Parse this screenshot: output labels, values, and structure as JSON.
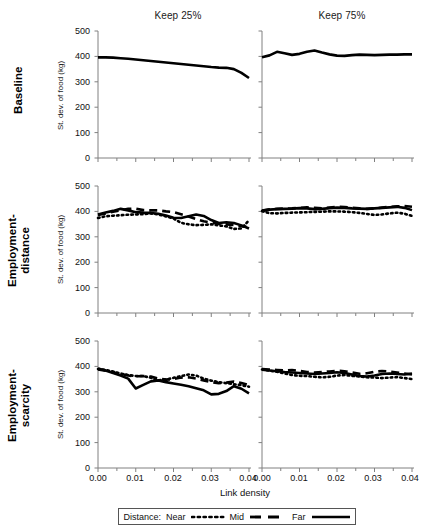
{
  "figure": {
    "column_titles": [
      "Keep 25%",
      "Keep 75%"
    ],
    "row_labels": [
      "Baseline",
      "Employment-\ndistance",
      "Employment-\nscarcity"
    ],
    "ylabel": "St. dev. of food (kg)",
    "xlabel": "Link density",
    "yticks": [
      "500",
      "400",
      "300",
      "200",
      "100",
      "0"
    ],
    "xticks": [
      "0.00",
      "0.01",
      "0.02",
      "0.03",
      "0.04"
    ]
  },
  "legend": {
    "title": "Distance:",
    "entries": [
      {
        "label": "Near",
        "style": "dotted"
      },
      {
        "label": "Mid",
        "style": "dashed"
      },
      {
        "label": "Far",
        "style": "solid"
      }
    ]
  },
  "colors": {
    "line": "#000000",
    "axis": "#808080",
    "text": "#111111",
    "background": "#ffffff"
  },
  "chart_data": {
    "type": "line",
    "title": "",
    "xlabel": "Link density",
    "ylabel": "St. dev. of food (kg)",
    "xlim": [
      0.0,
      0.04
    ],
    "ylim": [
      0,
      500
    ],
    "grid": false,
    "legend_position": "bottom",
    "legend_entries": [
      "Near",
      "Mid",
      "Far"
    ],
    "row_labels": [
      "Baseline",
      "Employment-distance",
      "Employment-scarcity"
    ],
    "column_labels": [
      "Keep 25%",
      "Keep 75%"
    ],
    "panels": [
      {
        "row": "Baseline",
        "column": "Keep 25%",
        "x": [
          0.0,
          0.002,
          0.004,
          0.006,
          0.008,
          0.01,
          0.012,
          0.014,
          0.016,
          0.018,
          0.02,
          0.022,
          0.024,
          0.026,
          0.028,
          0.03,
          0.032,
          0.034,
          0.036,
          0.038,
          0.04
        ],
        "series": [
          {
            "name": "Far",
            "style": "solid",
            "values": [
              396,
              396,
              395,
              393,
              391,
              388,
              385,
              382,
              379,
              376,
              373,
              370,
              367,
              364,
              361,
              358,
              356,
              355,
              350,
              335,
              315
            ]
          }
        ]
      },
      {
        "row": "Baseline",
        "column": "Keep 75%",
        "x": [
          0.0,
          0.002,
          0.004,
          0.006,
          0.008,
          0.01,
          0.012,
          0.014,
          0.016,
          0.018,
          0.02,
          0.022,
          0.024,
          0.026,
          0.028,
          0.03,
          0.032,
          0.034,
          0.036,
          0.038,
          0.04
        ],
        "series": [
          {
            "name": "Far",
            "style": "solid",
            "values": [
              397,
              404,
              418,
              412,
              406,
              410,
              418,
              423,
              415,
              408,
              403,
              402,
              405,
              407,
              406,
              405,
              406,
              407,
              407,
              408,
              408
            ]
          }
        ]
      },
      {
        "row": "Employment-distance",
        "column": "Keep 25%",
        "x": [
          0.0,
          0.002,
          0.004,
          0.006,
          0.008,
          0.01,
          0.012,
          0.014,
          0.016,
          0.018,
          0.02,
          0.022,
          0.024,
          0.026,
          0.028,
          0.03,
          0.032,
          0.034,
          0.036,
          0.038,
          0.04
        ],
        "series": [
          {
            "name": "Near",
            "style": "dotted",
            "values": [
              374,
              381,
              383,
              385,
              387,
              388,
              389,
              392,
              388,
              380,
              372,
              355,
              349,
              346,
              347,
              349,
              345,
              341,
              331,
              333,
              365
            ]
          },
          {
            "name": "Mid",
            "style": "dashed",
            "values": [
              386,
              392,
              399,
              404,
              410,
              411,
              405,
              404,
              404,
              400,
              397,
              389,
              380,
              370,
              361,
              356,
              352,
              349,
              346,
              342,
              338
            ]
          },
          {
            "name": "Far",
            "style": "solid",
            "values": [
              388,
              396,
              402,
              410,
              404,
              397,
              395,
              394,
              391,
              384,
              375,
              374,
              381,
              388,
              382,
              366,
              354,
              357,
              354,
              345,
              333
            ]
          }
        ]
      },
      {
        "row": "Employment-distance",
        "column": "Keep 75%",
        "x": [
          0.0,
          0.002,
          0.004,
          0.006,
          0.008,
          0.01,
          0.012,
          0.014,
          0.016,
          0.018,
          0.02,
          0.022,
          0.024,
          0.026,
          0.028,
          0.03,
          0.032,
          0.034,
          0.036,
          0.038,
          0.04
        ],
        "series": [
          {
            "name": "Near",
            "style": "dotted",
            "values": [
              401,
              393,
              392,
              394,
              395,
              396,
              397,
              398,
              399,
              400,
              400,
              399,
              397,
              394,
              390,
              386,
              388,
              392,
              395,
              391,
              382
            ]
          },
          {
            "name": "Mid",
            "style": "dashed",
            "values": [
              403,
              408,
              410,
              411,
              412,
              414,
              416,
              414,
              412,
              415,
              418,
              417,
              414,
              412,
              410,
              412,
              415,
              418,
              420,
              421,
              418
            ]
          },
          {
            "name": "Far",
            "style": "solid",
            "values": [
              402,
              407,
              409,
              410,
              411,
              413,
              412,
              409,
              410,
              413,
              415,
              414,
              412,
              411,
              410,
              412,
              414,
              416,
              418,
              414,
              405
            ]
          }
        ]
      },
      {
        "row": "Employment-scarcity",
        "column": "Keep 25%",
        "x": [
          0.0,
          0.002,
          0.004,
          0.006,
          0.008,
          0.01,
          0.012,
          0.014,
          0.016,
          0.018,
          0.02,
          0.022,
          0.024,
          0.026,
          0.028,
          0.03,
          0.032,
          0.034,
          0.036,
          0.038,
          0.04
        ],
        "series": [
          {
            "name": "Near",
            "style": "dotted",
            "values": [
              390,
              386,
              380,
              372,
              366,
              362,
              362,
              355,
              345,
              348,
              355,
              362,
              368,
              364,
              352,
              344,
              338,
              334,
              330,
              326,
              320
            ]
          },
          {
            "name": "Mid",
            "style": "dashed",
            "values": [
              388,
              383,
              377,
              370,
              364,
              361,
              362,
              360,
              352,
              348,
              350,
              356,
              357,
              352,
              345,
              338,
              334,
              336,
              340,
              335,
              326
            ]
          },
          {
            "name": "Far",
            "style": "solid",
            "values": [
              392,
              384,
              374,
              364,
              352,
              313,
              327,
              341,
              345,
              338,
              333,
              328,
              322,
              314,
              306,
              290,
              292,
              303,
              322,
              312,
              294
            ]
          }
        ]
      },
      {
        "row": "Employment-scarcity",
        "column": "Keep 75%",
        "x": [
          0.0,
          0.002,
          0.004,
          0.006,
          0.008,
          0.01,
          0.012,
          0.014,
          0.016,
          0.018,
          0.02,
          0.022,
          0.024,
          0.026,
          0.028,
          0.03,
          0.032,
          0.034,
          0.036,
          0.038,
          0.04
        ],
        "series": [
          {
            "name": "Near",
            "style": "dotted",
            "values": [
              388,
              383,
              379,
              372,
              366,
              363,
              362,
              359,
              357,
              359,
              364,
              366,
              363,
              360,
              357,
              356,
              354,
              356,
              358,
              354,
              350
            ]
          },
          {
            "name": "Mid",
            "style": "dashed",
            "values": [
              390,
              388,
              386,
              384,
              386,
              382,
              378,
              376,
              378,
              380,
              383,
              381,
              376,
              371,
              373,
              379,
              382,
              380,
              376,
              372,
              368
            ]
          },
          {
            "name": "Far",
            "style": "solid",
            "values": [
              387,
              384,
              381,
              378,
              376,
              374,
              372,
              370,
              372,
              374,
              377,
              374,
              368,
              362,
              360,
              364,
              370,
              372,
              370,
              368,
              372
            ]
          }
        ]
      }
    ]
  }
}
